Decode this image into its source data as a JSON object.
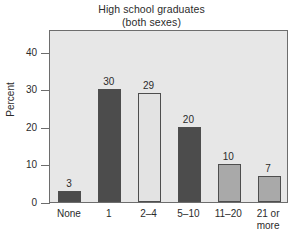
{
  "chart_data": {
    "type": "bar",
    "title": "High school graduates (both sexes)",
    "title_lines": [
      "High school graduates",
      "(both sexes)"
    ],
    "xlabel": "",
    "ylabel": "Percent",
    "categories": [
      "None",
      "1",
      "2–4",
      "5–10",
      "11–20",
      "21 or more"
    ],
    "category_lines": [
      [
        "None"
      ],
      [
        "1"
      ],
      [
        "2–4"
      ],
      [
        "5–10"
      ],
      [
        "11–20"
      ],
      [
        "21 or",
        "more"
      ]
    ],
    "values": [
      3,
      30,
      29,
      20,
      10,
      7
    ],
    "value_labels": [
      "3",
      "30",
      "29",
      "20",
      "10",
      "7"
    ],
    "bar_colors": [
      "#4c4c4c",
      "#4c4c4c",
      "#e3e3e3",
      "#4c4c4c",
      "#a9a9a9",
      "#a9a9a9"
    ],
    "bar_edge_color": "#4e4e4e",
    "ylim": [
      0,
      46
    ],
    "yticks": [
      0,
      10,
      20,
      30,
      40
    ],
    "ytick_labels": [
      "0",
      "10",
      "20",
      "30",
      "40"
    ],
    "grid": false,
    "legend": null,
    "plot_background": "#e7e7e7",
    "frame_color": "#6d6d6d",
    "figure_background": "#ffffff"
  }
}
